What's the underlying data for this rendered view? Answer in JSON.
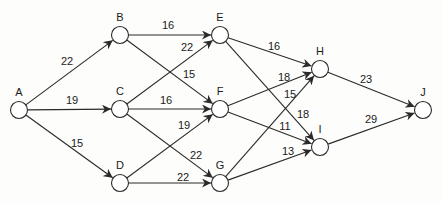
{
  "diagram": {
    "type": "directed-network",
    "nodes": [
      {
        "id": "A",
        "label": "A",
        "x": 19,
        "y": 110,
        "lx": 19,
        "ly": 96
      },
      {
        "id": "B",
        "label": "B",
        "x": 120,
        "y": 35,
        "lx": 120,
        "ly": 21
      },
      {
        "id": "C",
        "label": "C",
        "x": 120,
        "y": 109,
        "lx": 120,
        "ly": 95
      },
      {
        "id": "D",
        "label": "D",
        "x": 120,
        "y": 183,
        "lx": 120,
        "ly": 169
      },
      {
        "id": "E",
        "label": "E",
        "x": 220,
        "y": 35,
        "lx": 220,
        "ly": 21
      },
      {
        "id": "F",
        "label": "F",
        "x": 220,
        "y": 109,
        "lx": 220,
        "ly": 95
      },
      {
        "id": "G",
        "label": "G",
        "x": 220,
        "y": 183,
        "lx": 220,
        "ly": 169
      },
      {
        "id": "H",
        "label": "H",
        "x": 320,
        "y": 69,
        "lx": 320,
        "ly": 55
      },
      {
        "id": "I",
        "label": "I",
        "x": 320,
        "y": 147,
        "lx": 320,
        "ly": 133
      },
      {
        "id": "J",
        "label": "J",
        "x": 423,
        "y": 110,
        "lx": 423,
        "ly": 96
      }
    ],
    "edges": [
      {
        "from": "A",
        "to": "B",
        "weight": "22",
        "lx": 67,
        "ly": 65
      },
      {
        "from": "A",
        "to": "C",
        "weight": "19",
        "lx": 72,
        "ly": 104
      },
      {
        "from": "A",
        "to": "D",
        "weight": "15",
        "lx": 77,
        "ly": 147
      },
      {
        "from": "B",
        "to": "E",
        "weight": "16",
        "lx": 168,
        "ly": 29
      },
      {
        "from": "B",
        "to": "F",
        "weight": "15",
        "lx": 189,
        "ly": 78
      },
      {
        "from": "C",
        "to": "E",
        "weight": "22",
        "lx": 187,
        "ly": 51
      },
      {
        "from": "C",
        "to": "F",
        "weight": "16",
        "lx": 166,
        "ly": 104
      },
      {
        "from": "C",
        "to": "G",
        "weight": "22",
        "lx": 196,
        "ly": 159
      },
      {
        "from": "D",
        "to": "F",
        "weight": "19",
        "lx": 184,
        "ly": 129
      },
      {
        "from": "D",
        "to": "G",
        "weight": "22",
        "lx": 183,
        "ly": 181
      },
      {
        "from": "E",
        "to": "H",
        "weight": "16",
        "lx": 274,
        "ly": 50
      },
      {
        "from": "E",
        "to": "I",
        "weight": "18",
        "lx": 303,
        "ly": 118
      },
      {
        "from": "F",
        "to": "H",
        "weight": "18",
        "lx": 284,
        "ly": 81
      },
      {
        "from": "F",
        "to": "I",
        "weight": "11",
        "lx": 285,
        "ly": 130
      },
      {
        "from": "G",
        "to": "H",
        "weight": "15",
        "lx": 290,
        "ly": 98
      },
      {
        "from": "G",
        "to": "I",
        "weight": "13",
        "lx": 288,
        "ly": 155
      },
      {
        "from": "H",
        "to": "J",
        "weight": "23",
        "lx": 366,
        "ly": 83
      },
      {
        "from": "I",
        "to": "J",
        "weight": "29",
        "lx": 371,
        "ly": 123
      }
    ],
    "node_radius": 8.5,
    "colors": {
      "line": "#2a2a2a",
      "node_fill": "#ffffff",
      "background": "#fdfdfb",
      "text": "#1a1a1a"
    }
  }
}
